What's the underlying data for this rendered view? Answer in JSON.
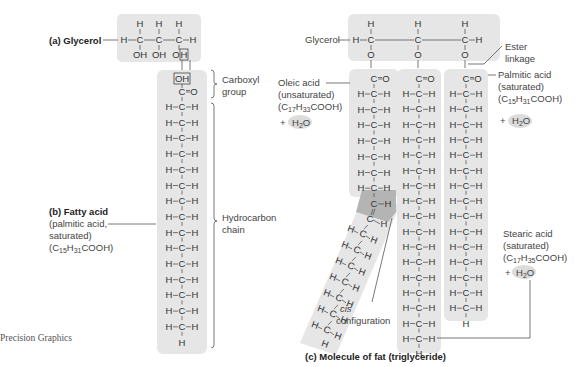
{
  "panel_a": {
    "label": "(a) Glycerol",
    "top_h": [
      "H",
      "H",
      "H"
    ],
    "backbone": "H–C–C–C–H",
    "bottom": [
      "OH",
      "OH",
      "OH"
    ]
  },
  "panel_b": {
    "title": "(b) Fatty acid",
    "desc1": "(palmitic acid,",
    "desc2": "saturated)",
    "formula": "(C15H31COOH)",
    "carboxyl_label1": "Carboxyl",
    "carboxyl_label2": "group",
    "hydrocarbon_label1": "Hydrocarbon",
    "hydrocarbon_label2": "chain",
    "oh": "OH",
    "co": "C=O",
    "ch2_rows": 15,
    "row": "H–C–H",
    "end": "H"
  },
  "panel_c": {
    "title": "(c) Molecule of fat (triglyceride)",
    "glycerol_label": "Glycerol",
    "ester_label1": "Ester",
    "ester_label2": "linkage",
    "oleic": {
      "name": "Oleic acid",
      "type": "(unsaturated)",
      "formula": "(C17H33COOH)",
      "plus": "+",
      "water": "H2O",
      "upper_rows": 7,
      "lower_rows": 7
    },
    "middle": {
      "rows": 17
    },
    "palmitic": {
      "name": "Palmitic acid",
      "type": "(saturated)",
      "formula": "(C15H31COOH)",
      "plus": "+",
      "water": "H2O",
      "rows": 15
    },
    "stearic": {
      "name": "Stearic acid",
      "type": "(saturated)",
      "formula": "(C17H35COOH)",
      "plus": "+",
      "water": "H2O"
    },
    "cis_label1": "cis",
    "cis_label2": "configuration"
  },
  "credit": "Precision Graphics",
  "colors": {
    "box": "#e6e6e6",
    "highlight": "#b4b4b4",
    "text": "#333333"
  }
}
